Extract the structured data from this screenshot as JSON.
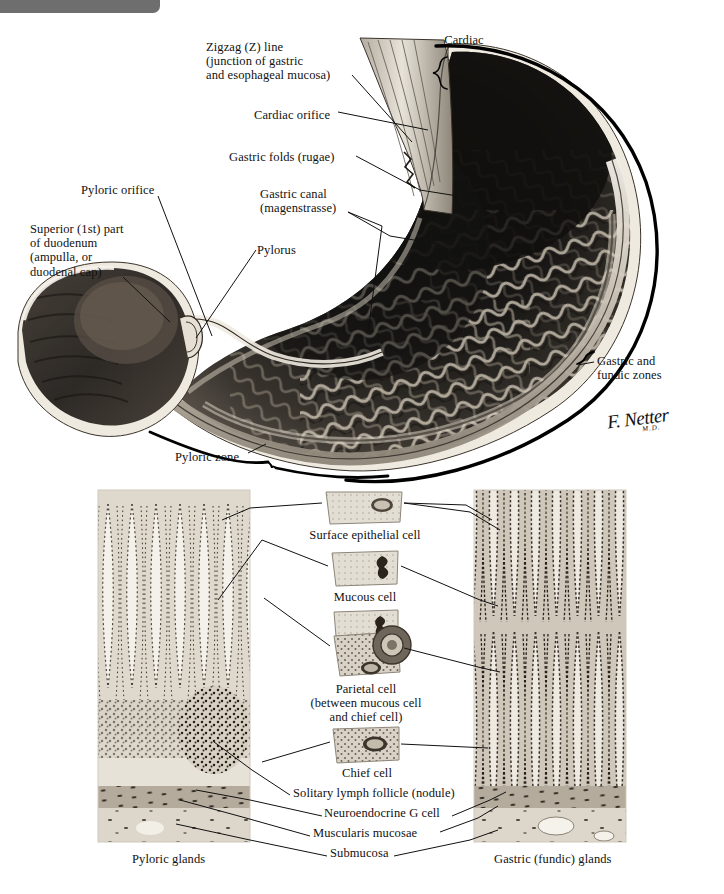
{
  "plate": {
    "title": "Stomach: mucosa and musculature",
    "signature": {
      "name": "F. Netter",
      "credential": "M.D."
    }
  },
  "gross_figure": {
    "labels": [
      {
        "id": "zigzag-line",
        "text": "Zigzag (Z) line\n(junction of gastric\nand esophageal mucosa)",
        "x": 206,
        "y": 40,
        "align": "left"
      },
      {
        "id": "cardiac-zone",
        "text": "Cardiac\nzone",
        "x": 433,
        "y": 33,
        "align": "left"
      },
      {
        "id": "cardiac-orifice",
        "text": "Cardiac orifice",
        "x": 254,
        "y": 108,
        "align": "left"
      },
      {
        "id": "gastric-folds-rugae",
        "text": "Gastric folds (rugae)",
        "x": 229,
        "y": 150,
        "align": "left"
      },
      {
        "id": "pyloric-orifice",
        "text": "Pyloric orifice",
        "x": 81,
        "y": 183,
        "align": "left"
      },
      {
        "id": "gastric-canal",
        "text": "Gastric canal\n(magenstrasse)",
        "x": 260,
        "y": 187,
        "align": "left"
      },
      {
        "id": "pylorus",
        "text": "Pylorus",
        "x": 257,
        "y": 243,
        "align": "left"
      },
      {
        "id": "superior-part-duodenum",
        "text": "Superior (1st) part\nof duodenum\n(ampulla, or\nduodenal cap)",
        "x": 30,
        "y": 222,
        "align": "left"
      },
      {
        "id": "gastric-and-fundic-zones",
        "text": "Gastric and\nfundic zones",
        "x": 597,
        "y": 354,
        "align": "left"
      },
      {
        "id": "pyloric-zone",
        "text": "Pyloric zone",
        "x": 175,
        "y": 450,
        "align": "left"
      }
    ]
  },
  "histology_figure": {
    "left_panel_caption": "Pyloric glands",
    "right_panel_caption": "Gastric (fundic) glands",
    "cell_insets": [
      {
        "id": "surface-epithelial-cell",
        "caption": "Surface epithelial cell"
      },
      {
        "id": "mucous-cell",
        "caption": "Mucous cell"
      },
      {
        "id": "parietal-cell",
        "caption": "Parietal cell\n(between mucous cell\nand chief cell)"
      },
      {
        "id": "chief-cell",
        "caption": "Chief cell"
      }
    ],
    "layer_labels": [
      {
        "id": "solitary-lymph-follicle",
        "text": "Solitary lymph follicle (nodule)",
        "x": 293,
        "y": 793
      },
      {
        "id": "neuroendocrine-g-cell",
        "text": "Neuroendocrine G cell",
        "x": 324,
        "y": 813
      },
      {
        "id": "muscularis-mucosae",
        "text": "Muscularis mucosae",
        "x": 313,
        "y": 833
      },
      {
        "id": "submucosa",
        "text": "Submucosa",
        "x": 330,
        "y": 853
      }
    ]
  },
  "colors": {
    "ink": "#111111",
    "paper": "#ffffff",
    "ui_strip": "#6e6e6e",
    "tissue_dark": "#2b2825",
    "tissue_mid": "#6e675f",
    "tissue_light": "#c9c2b6",
    "serosa": "#efeae0",
    "histology_tint": "#b9b2a6"
  }
}
